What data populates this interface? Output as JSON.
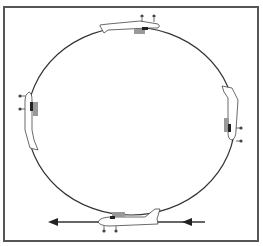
{
  "diagram": {
    "labels": [],
    "path": {
      "shape": "loop",
      "stroke": "#333333"
    },
    "entry_arrow": {
      "direction": "left",
      "color": "#333333"
    },
    "exit_arrow": {
      "direction": "left",
      "color": "#333333"
    },
    "aircraft_positions": [
      "bottom-level",
      "right-climbing-vertical",
      "top-inverted",
      "left-descending-vertical"
    ],
    "colors": {
      "frame": "#555555",
      "aircraft_outline": "#444444",
      "cockpit": "#888888",
      "engine": "#222222",
      "background": "#ffffff"
    }
  }
}
